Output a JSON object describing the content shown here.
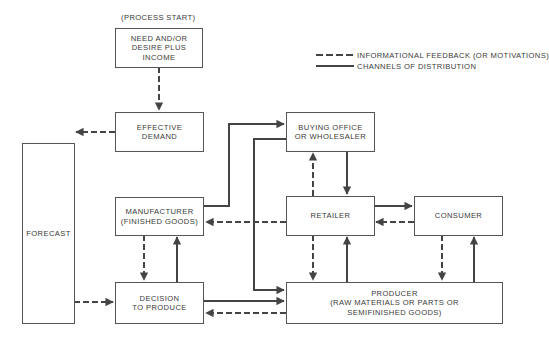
{
  "diagram": {
    "start_label": "(PROCESS START)",
    "legend": [
      {
        "style": "dashed",
        "label": "INFORMATIONAL FEEDBACK (OR MOTIVATIONS)"
      },
      {
        "style": "solid",
        "label": "CHANNELS OF DISTRIBUTION"
      }
    ],
    "nodes": {
      "need": "NEED AND/OR\nDESIRE PLUS\nINCOME",
      "demand": "EFFECTIVE\nDEMAND",
      "forecast": "FORECAST",
      "manufacturer": "MANUFACTURER\n(FINISHED GOODS)",
      "decision": "DECISION\nTO PRODUCE",
      "buying": "BUYING OFFICE\nOR WHOLESALER",
      "retailer": "RETAILER",
      "consumer": "CONSUMER",
      "producer": "PRODUCER\n(RAW MATERIALS OR PARTS OR\nSEMIFINISHED GOODS)"
    },
    "edges": [
      {
        "from": "need",
        "to": "demand",
        "type": "dashed"
      },
      {
        "from": "demand",
        "to": "forecast",
        "type": "dashed"
      },
      {
        "from": "forecast",
        "to": "decision",
        "type": "dashed"
      },
      {
        "from": "manufacturer",
        "to": "decision",
        "type": "dashed"
      },
      {
        "from": "decision",
        "to": "manufacturer",
        "type": "solid"
      },
      {
        "from": "manufacturer",
        "to": "buying",
        "type": "solid"
      },
      {
        "from": "buying",
        "to": "producer",
        "type": "solid"
      },
      {
        "from": "retailer",
        "to": "buying",
        "type": "dashed"
      },
      {
        "from": "buying",
        "to": "retailer",
        "type": "solid"
      },
      {
        "from": "retailer",
        "to": "consumer",
        "type": "solid"
      },
      {
        "from": "consumer",
        "to": "retailer",
        "type": "dashed"
      },
      {
        "from": "retailer",
        "to": "manufacturer",
        "type": "dashed"
      },
      {
        "from": "retailer",
        "to": "producer",
        "type": "dashed"
      },
      {
        "from": "producer",
        "to": "retailer",
        "type": "solid"
      },
      {
        "from": "consumer",
        "to": "producer",
        "type": "dashed"
      },
      {
        "from": "producer",
        "to": "consumer",
        "type": "solid"
      },
      {
        "from": "decision",
        "to": "producer",
        "type": "solid"
      },
      {
        "from": "producer",
        "to": "decision",
        "type": "dashed"
      }
    ]
  }
}
